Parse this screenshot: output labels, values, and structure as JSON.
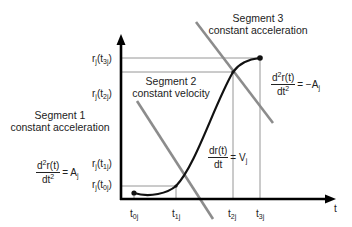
{
  "diagram": {
    "axes": {
      "x_label": "t",
      "x_ticks": [
        {
          "base": "t",
          "sub": "0j"
        },
        {
          "base": "t",
          "sub": "1j"
        },
        {
          "base": "t",
          "sub": "2j"
        },
        {
          "base": "t",
          "sub": "3j"
        }
      ],
      "y_ticks": [
        {
          "pre": "r",
          "presub": "j",
          "mid": "(t",
          "sub": "3j",
          "post": ")"
        },
        {
          "pre": "r",
          "presub": "j",
          "mid": "(t",
          "sub": "2j",
          "post": ")"
        },
        {
          "pre": "r",
          "presub": "j",
          "mid": "(t",
          "sub": "1j",
          "post": ")"
        },
        {
          "pre": "r",
          "presub": "j",
          "mid": "(t",
          "sub": "0j",
          "post": ")"
        }
      ]
    },
    "segments": [
      {
        "title": "Segment 1",
        "subtitle": "constant  acceleration"
      },
      {
        "title": "Segment 2",
        "subtitle": "constant velocity"
      },
      {
        "title": "Segment 3",
        "subtitle": "constant acceleration"
      }
    ],
    "equations": {
      "seg1": {
        "num_a": "d",
        "num_sup": "2",
        "num_b": "r(t)",
        "den_a": "dt",
        "den_sup": "2",
        "rhs_a": "= A",
        "rhs_sub": "j"
      },
      "seg2": {
        "num_a": "dr(t)",
        "den_a": "dt",
        "rhs_a": "= V",
        "rhs_sub": "j"
      },
      "seg3": {
        "num_a": "d",
        "num_sup": "2",
        "num_b": "r(t)",
        "den_a": "dt",
        "den_sup": "2",
        "rhs_a": "= −A",
        "rhs_sub": "j"
      }
    },
    "colors": {
      "axis": "#000000",
      "curve": "#111111",
      "tangent": "#8c8c8c",
      "guide": "#8a8a8a"
    }
  }
}
